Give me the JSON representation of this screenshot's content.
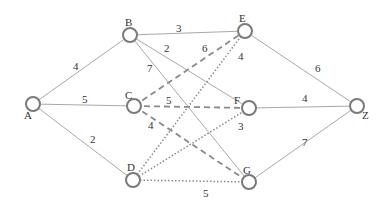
{
  "graph": {
    "type": "weighted-graph",
    "nodes": [
      {
        "id": "A",
        "label": "A",
        "x": 33,
        "y": 104,
        "lx": 24,
        "ly": 119
      },
      {
        "id": "B",
        "label": "B",
        "x": 130,
        "y": 35,
        "lx": 125,
        "ly": 26
      },
      {
        "id": "C",
        "label": "C",
        "x": 134,
        "y": 106,
        "lx": 125,
        "ly": 99
      },
      {
        "id": "D",
        "label": "D",
        "x": 133,
        "y": 180,
        "lx": 127,
        "ly": 171
      },
      {
        "id": "E",
        "label": "E",
        "x": 245,
        "y": 31,
        "lx": 239,
        "ly": 22
      },
      {
        "id": "F",
        "label": "F",
        "x": 249,
        "y": 108,
        "lx": 234,
        "ly": 104
      },
      {
        "id": "G",
        "label": "G",
        "x": 249,
        "y": 182,
        "lx": 243,
        "ly": 174
      },
      {
        "id": "Z",
        "label": "Z",
        "x": 357,
        "y": 106,
        "lx": 362,
        "ly": 119
      }
    ],
    "edges": [
      {
        "from": "A",
        "to": "B",
        "weight": "4",
        "style": "solid",
        "lx": 73,
        "ly": 70
      },
      {
        "from": "A",
        "to": "C",
        "weight": "5",
        "style": "solid",
        "lx": 82,
        "ly": 103
      },
      {
        "from": "A",
        "to": "D",
        "weight": "2",
        "style": "solid",
        "lx": 90,
        "ly": 143
      },
      {
        "from": "B",
        "to": "E",
        "weight": "3",
        "style": "solid",
        "lx": 176,
        "ly": 32
      },
      {
        "from": "B",
        "to": "F",
        "weight": "2",
        "style": "solid",
        "lx": 164,
        "ly": 52
      },
      {
        "from": "B",
        "to": "G",
        "weight": "7",
        "style": "solid",
        "lx": 147,
        "ly": 72
      },
      {
        "from": "C",
        "to": "E",
        "weight": "6",
        "style": "dashed",
        "lx": 202,
        "ly": 52
      },
      {
        "from": "C",
        "to": "F",
        "weight": "5",
        "style": "dashed",
        "lx": 166,
        "ly": 104
      },
      {
        "from": "C",
        "to": "G",
        "weight": "4",
        "style": "dashed",
        "lx": 148,
        "ly": 129
      },
      {
        "from": "D",
        "to": "E",
        "weight": "4",
        "style": "dotted",
        "lx": 238,
        "ly": 60
      },
      {
        "from": "D",
        "to": "F",
        "weight": "3",
        "style": "dotted",
        "lx": 238,
        "ly": 130
      },
      {
        "from": "D",
        "to": "G",
        "weight": "5",
        "style": "dotted",
        "lx": 203,
        "ly": 197
      },
      {
        "from": "E",
        "to": "Z",
        "weight": "6",
        "style": "solid",
        "lx": 315,
        "ly": 72
      },
      {
        "from": "F",
        "to": "Z",
        "weight": "4",
        "style": "solid",
        "lx": 302,
        "ly": 102
      },
      {
        "from": "G",
        "to": "Z",
        "weight": "7",
        "style": "solid",
        "lx": 302,
        "ly": 146
      }
    ]
  },
  "colors": {
    "node_stroke": "#7a7a7a",
    "solid_edge": "#a8a8a8",
    "dashed_edge": "#8a8a8a",
    "dotted_edge": "#8a8a8a",
    "label": "#333333"
  }
}
